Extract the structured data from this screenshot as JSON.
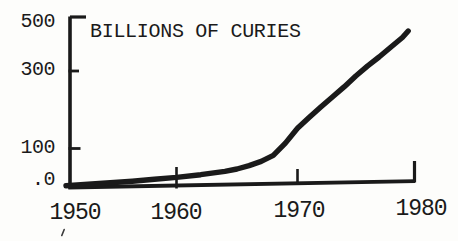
{
  "figure": {
    "title": "BILLIONS OF CURIES"
  },
  "colors": {
    "ink": "#1a1a1a",
    "paper": "#fdfdfb"
  },
  "y_axis": {
    "ticks": [
      {
        "label": "500",
        "value": 500
      },
      {
        "label": "300",
        "value": 300
      },
      {
        "label": "100",
        "value": 100
      },
      {
        "label": ".0",
        "value": 0
      }
    ]
  },
  "x_axis": {
    "ticks": [
      {
        "label": "1950",
        "value": 1950
      },
      {
        "label": "1960",
        "value": 1960
      },
      {
        "label": "1970",
        "value": 1970
      },
      {
        "label": "1980",
        "value": 1980
      }
    ]
  },
  "chart_data": {
    "type": "line",
    "title": "BILLIONS OF CURIES",
    "xlabel": "",
    "ylabel": "BILLIONS OF CURIES",
    "xlim": [
      1950,
      1980
    ],
    "ylim": [
      0,
      500
    ],
    "x_ticks": [
      1950,
      1960,
      1970,
      1980
    ],
    "y_ticks": [
      0,
      100,
      300,
      500
    ],
    "y_tick_labels_top_to_bottom": [
      "500",
      "300",
      "100",
      ".0"
    ],
    "grid": false,
    "legend": null,
    "series_name": "accumulated radioactivity (billions of curies)",
    "x": [
      1950,
      1952,
      1954,
      1956,
      1958,
      1960,
      1962,
      1964,
      1965,
      1966,
      1967,
      1968,
      1969,
      1970,
      1971,
      1972,
      1973,
      1974,
      1975,
      1976,
      1977,
      1978,
      1979,
      1979.5
    ],
    "values": [
      2,
      6,
      10,
      14,
      19,
      24,
      31,
      40,
      46,
      55,
      66,
      82,
      114,
      152,
      180,
      207,
      233,
      259,
      287,
      318,
      352,
      388,
      424,
      448
    ]
  }
}
